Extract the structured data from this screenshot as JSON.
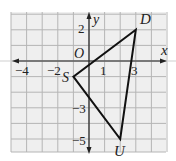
{
  "figure": {
    "type": "coordinate-plane-triangle",
    "grid": {
      "x_min": -5,
      "x_max": 5,
      "y_min": -5.75,
      "y_max": 3,
      "background": "#efefef",
      "line_color": "#b5b5b5"
    },
    "axes": {
      "x_label": "x",
      "y_label": "y",
      "origin_label": "O",
      "x_tick_labels": [
        {
          "value": -4,
          "text": "−4"
        },
        {
          "value": -2,
          "text": "−2"
        },
        {
          "value": 1,
          "text": "1"
        },
        {
          "value": 3,
          "text": "3"
        }
      ],
      "y_tick_labels": [
        {
          "value": 2,
          "text": "2"
        },
        {
          "value": -3,
          "text": "−3"
        },
        {
          "value": -5,
          "text": "−5"
        }
      ]
    },
    "triangle": {
      "vertices": [
        {
          "name": "D",
          "x": 3,
          "y": 2
        },
        {
          "name": "S",
          "x": -1,
          "y": -1
        },
        {
          "name": "U",
          "x": 2,
          "y": -5
        }
      ],
      "stroke": "#111111"
    }
  }
}
